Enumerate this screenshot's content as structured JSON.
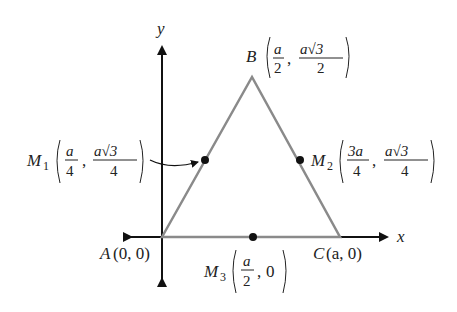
{
  "diagram": {
    "type": "coordinate-geometry",
    "axes": {
      "x_label": "x",
      "y_label": "y"
    },
    "vertices": {
      "A": {
        "name": "A",
        "coords": "(0, 0)"
      },
      "B": {
        "name": "B",
        "x_num": "a",
        "x_den": "2",
        "y_num": "a√3",
        "y_den": "2"
      },
      "C": {
        "name": "C",
        "coords": "(a, 0)"
      }
    },
    "midpoints": {
      "M1": {
        "name": "M",
        "sub": "1",
        "x_num": "a",
        "x_den": "4",
        "y_num": "a√3",
        "y_den": "4"
      },
      "M2": {
        "name": "M",
        "sub": "2",
        "x_num": "3a",
        "x_den": "4",
        "y_num": "a√3",
        "y_den": "4"
      },
      "M3": {
        "name": "M",
        "sub": "3",
        "x_num": "a",
        "x_den": "2",
        "y_val": "0"
      }
    },
    "colors": {
      "axes": "#111111",
      "triangle": "#8a8a8a",
      "points": "#111111"
    }
  }
}
